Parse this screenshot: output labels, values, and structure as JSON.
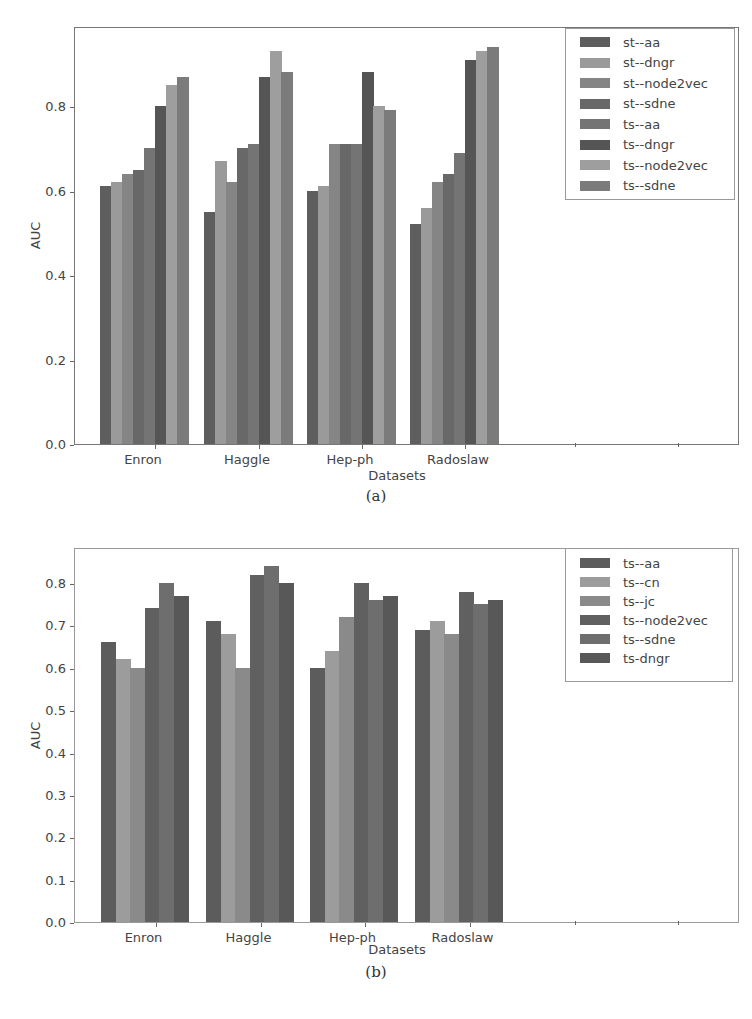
{
  "chart_data": [
    {
      "id": "a",
      "type": "bar",
      "title": "",
      "caption": "(a)",
      "xlabel": "Datasets",
      "ylabel": "AUC",
      "ylim": [
        0.0,
        0.99
      ],
      "yticks": [
        "0.0",
        "0.2",
        "0.4",
        "0.6",
        "0.8"
      ],
      "ytick_values": [
        0.0,
        0.2,
        0.4,
        0.6,
        0.8
      ],
      "grid": false,
      "legend_position": "upper right",
      "categories": [
        "Enron",
        "Haggle",
        "Hep-ph",
        "Radoslaw"
      ],
      "series": [
        {
          "name": "st--aa",
          "color": "#5e5e5e",
          "values": [
            0.61,
            0.55,
            0.6,
            0.52
          ]
        },
        {
          "name": "st--dngr",
          "color": "#9a9a9a",
          "values": [
            0.62,
            0.67,
            0.61,
            0.56
          ]
        },
        {
          "name": "st--node2vec",
          "color": "#858585",
          "values": [
            0.64,
            0.62,
            0.71,
            0.62
          ]
        },
        {
          "name": "st--sdne",
          "color": "#686868",
          "values": [
            0.65,
            0.7,
            0.71,
            0.64
          ]
        },
        {
          "name": "ts--aa",
          "color": "#747474",
          "values": [
            0.7,
            0.71,
            0.71,
            0.69
          ]
        },
        {
          "name": "ts--dngr",
          "color": "#555555",
          "values": [
            0.8,
            0.87,
            0.88,
            0.91
          ]
        },
        {
          "name": "ts--node2vec",
          "color": "#9e9e9e",
          "values": [
            0.85,
            0.93,
            0.8,
            0.93
          ]
        },
        {
          "name": "ts--sdne",
          "color": "#7b7b7b",
          "values": [
            0.87,
            0.88,
            0.79,
            0.94
          ]
        }
      ]
    },
    {
      "id": "b",
      "type": "bar",
      "title": "",
      "caption": "(b)",
      "xlabel": "Datasets",
      "ylabel": "AUC",
      "ylim": [
        0.0,
        0.885
      ],
      "yticks": [
        "0.0",
        "0.1",
        "0.2",
        "0.3",
        "0.4",
        "0.5",
        "0.6",
        "0.7",
        "0.8"
      ],
      "ytick_values": [
        0.0,
        0.1,
        0.2,
        0.3,
        0.4,
        0.5,
        0.6,
        0.7,
        0.8
      ],
      "grid": false,
      "legend_position": "upper right",
      "categories": [
        "Enron",
        "Haggle",
        "Hep-ph",
        "Radoslaw"
      ],
      "series": [
        {
          "name": "ts--aa",
          "color": "#5c5c5c",
          "values": [
            0.66,
            0.71,
            0.6,
            0.69
          ]
        },
        {
          "name": "ts--cn",
          "color": "#9c9c9c",
          "values": [
            0.62,
            0.68,
            0.64,
            0.71
          ]
        },
        {
          "name": "ts--jc",
          "color": "#8a8a8a",
          "values": [
            0.6,
            0.6,
            0.72,
            0.68
          ]
        },
        {
          "name": "ts--node2vec",
          "color": "#606060",
          "values": [
            0.74,
            0.82,
            0.8,
            0.78
          ]
        },
        {
          "name": "ts--sdne",
          "color": "#6e6e6e",
          "values": [
            0.8,
            0.84,
            0.76,
            0.75
          ]
        },
        {
          "name": "ts-dngr",
          "color": "#585858",
          "values": [
            0.77,
            0.8,
            0.77,
            0.76
          ]
        }
      ]
    }
  ]
}
